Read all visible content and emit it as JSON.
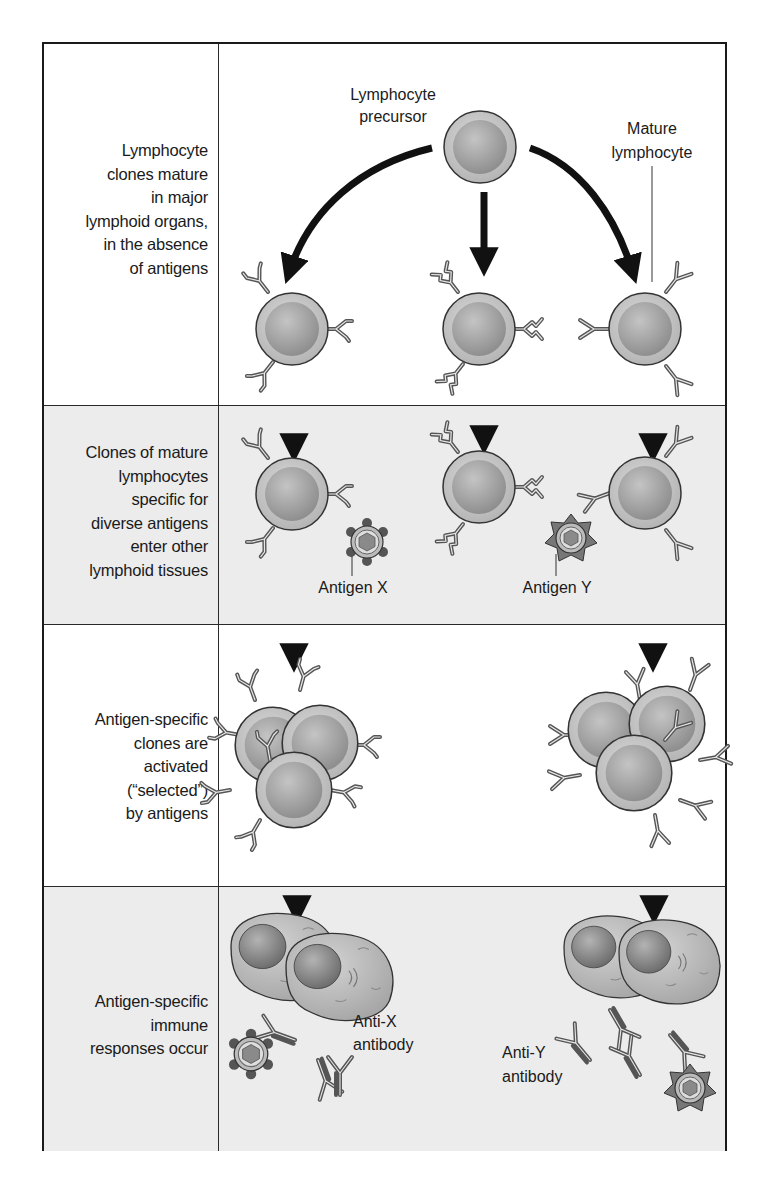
{
  "figure": {
    "rows": [
      {
        "id": "maturation",
        "label_lines": [
          "Lymphocyte",
          "clones mature",
          "in major",
          "lymphoid organs,",
          "in the absence",
          "of antigens"
        ],
        "shaded": false
      },
      {
        "id": "diverse-clones",
        "label_lines": [
          "Clones of mature",
          "lymphocytes",
          "specific for",
          "diverse antigens",
          "enter other",
          "lymphoid tissues"
        ],
        "shaded": true
      },
      {
        "id": "activation",
        "label_lines": [
          "Antigen-specific",
          "clones are",
          "activated",
          "(“selected”)",
          "by antigens"
        ],
        "shaded": false
      },
      {
        "id": "response",
        "label_lines": [
          "Antigen-specific",
          "immune",
          "responses occur"
        ],
        "shaded": true
      }
    ],
    "callouts": {
      "precursor": [
        "Lymphocyte",
        "precursor"
      ],
      "mature": [
        "Mature",
        "lymphocyte"
      ],
      "antigen_x": "Antigen X",
      "antigen_y": "Antigen Y",
      "anti_x": [
        "Anti-X",
        "antibody"
      ],
      "anti_y": [
        "Anti-Y",
        "antibody"
      ]
    },
    "colors": {
      "border": "#1a1a1a",
      "shaded_row": "#ececec",
      "cell_outer": "#c8c8c8",
      "cell_inner": "#a9a9a9",
      "receptor": "#555555",
      "arrow": "#111111"
    }
  }
}
